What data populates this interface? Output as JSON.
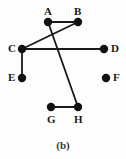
{
  "figure": {
    "caption": "(b)",
    "width": 126,
    "height": 159,
    "background_color": "#fdfdfd",
    "stroke_color": "#1a1a1a",
    "node_fill_color": "#111111",
    "node_radius": 4.2,
    "edge_width": 1.8
  },
  "chart_data": {
    "type": "diagram",
    "subtype": "undirected-graph",
    "title": "(b)",
    "xlabel": "",
    "ylabel": "",
    "nodes": [
      {
        "id": "A",
        "label": "A",
        "x": 48,
        "y": 22,
        "label_x": 44,
        "label_y": 6,
        "label_pos": "above"
      },
      {
        "id": "B",
        "label": "B",
        "x": 78,
        "y": 22,
        "label_x": 74,
        "label_y": 6,
        "label_pos": "above"
      },
      {
        "id": "C",
        "label": "C",
        "x": 22,
        "y": 49,
        "label_x": 8,
        "label_y": 43,
        "label_pos": "left"
      },
      {
        "id": "D",
        "label": "D",
        "x": 104,
        "y": 49,
        "label_x": 111,
        "label_y": 43,
        "label_pos": "right"
      },
      {
        "id": "E",
        "label": "E",
        "x": 22,
        "y": 78,
        "label_x": 8,
        "label_y": 72,
        "label_pos": "left"
      },
      {
        "id": "F",
        "label": "F",
        "x": 106,
        "y": 78,
        "label_x": 113,
        "label_y": 72,
        "label_pos": "right"
      },
      {
        "id": "G",
        "label": "G",
        "x": 51,
        "y": 107,
        "label_x": 47,
        "label_y": 114,
        "label_pos": "below"
      },
      {
        "id": "H",
        "label": "H",
        "x": 78,
        "y": 107,
        "label_x": 74,
        "label_y": 114,
        "label_pos": "below"
      }
    ],
    "edges": [
      {
        "id": "edge-A-B",
        "source": "A",
        "target": "B"
      },
      {
        "id": "edge-C-B",
        "source": "C",
        "target": "B"
      },
      {
        "id": "edge-A-H",
        "source": "A",
        "target": "H"
      },
      {
        "id": "edge-C-D",
        "source": "C",
        "target": "D"
      },
      {
        "id": "edge-C-E",
        "source": "C",
        "target": "E"
      },
      {
        "id": "edge-G-H",
        "source": "G",
        "target": "H"
      }
    ],
    "isolated_nodes": [
      "F"
    ],
    "node_count": 8,
    "edge_count": 6,
    "legend": [],
    "annotations": []
  }
}
